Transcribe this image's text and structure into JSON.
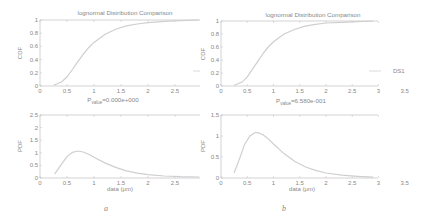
{
  "panels": [
    {
      "id": "a",
      "caption": "a",
      "cdf_title": "lognormal Distribution Comparison",
      "pdf_title_prefix": "P",
      "pdf_title_sub": "value",
      "pdf_title_suffix": "=0.000e+000",
      "cdf_ylabel": "CDF",
      "pdf_ylabel": "PDF",
      "xlabel": "data (μm)"
    },
    {
      "id": "b",
      "caption": "b",
      "cdf_title": "lognormal Distribution Comparison",
      "pdf_title_prefix": "P",
      "pdf_title_sub": "value",
      "pdf_title_suffix": "=6.580e-001",
      "cdf_ylabel": "CDF",
      "pdf_ylabel": "PDF",
      "xlabel": "data (μm)",
      "legend": "DS1"
    }
  ],
  "chart_data": [
    {
      "type": "line",
      "panel": "a-top",
      "title": "lognormal Distribution Comparison",
      "xlabel": "",
      "ylabel": "CDF",
      "xlim": [
        0,
        2.95
      ],
      "ylim": [
        0,
        1
      ],
      "xticks": [
        "0",
        "0.5",
        "1",
        "1.5",
        "2",
        "2.5"
      ],
      "yticks": [
        "0",
        "0.2",
        "0.4",
        "0.6",
        "0.8",
        "1"
      ],
      "series": [
        {
          "name": "lognormal CDF",
          "x": [
            0.25,
            0.4,
            0.5,
            0.6,
            0.7,
            0.8,
            0.9,
            1.0,
            1.2,
            1.4,
            1.6,
            1.8,
            2.0,
            2.3,
            2.6,
            2.95
          ],
          "y": [
            0.01,
            0.06,
            0.14,
            0.25,
            0.37,
            0.48,
            0.58,
            0.66,
            0.78,
            0.86,
            0.91,
            0.94,
            0.96,
            0.98,
            0.99,
            1.0
          ]
        }
      ],
      "grid": false
    },
    {
      "type": "line",
      "panel": "a-bottom",
      "title": "P_value=0.000e+000",
      "xlabel": "data (μm)",
      "ylabel": "PDF",
      "xlim": [
        0,
        2.95
      ],
      "ylim": [
        0,
        2.5
      ],
      "xticks": [
        "0",
        "0.5",
        "1",
        "1.5",
        "2",
        "2.5"
      ],
      "yticks": [
        "0",
        "0.5",
        "1",
        "1.5",
        "2",
        "2.5"
      ],
      "series": [
        {
          "name": "lognormal PDF",
          "x": [
            0.27,
            0.4,
            0.5,
            0.6,
            0.7,
            0.8,
            0.9,
            1.0,
            1.2,
            1.4,
            1.6,
            1.8,
            2.0,
            2.3,
            2.6,
            2.95
          ],
          "y": [
            0.15,
            0.55,
            0.85,
            1.02,
            1.07,
            1.03,
            0.94,
            0.82,
            0.6,
            0.42,
            0.28,
            0.19,
            0.13,
            0.08,
            0.05,
            0.04
          ]
        }
      ],
      "grid": false
    },
    {
      "type": "line",
      "panel": "b-top",
      "title": "lognormal Distribution Comparison",
      "xlabel": "",
      "ylabel": "CDF",
      "xlim": [
        0,
        3
      ],
      "ylim": [
        0,
        1
      ],
      "xticks": [
        "0",
        "0.5",
        "1",
        "1.5",
        "2",
        "2.5",
        "3",
        "3.5"
      ],
      "yticks": [
        "0",
        "0.2",
        "0.4",
        "0.6",
        "0.8",
        "1"
      ],
      "legend": [
        "DS1"
      ],
      "legend_position": "lower right outside",
      "series": [
        {
          "name": "DS1",
          "x": [
            0.25,
            0.4,
            0.5,
            0.6,
            0.7,
            0.8,
            0.9,
            1.0,
            1.2,
            1.4,
            1.6,
            1.8,
            2.0,
            2.3,
            2.6,
            2.9
          ],
          "y": [
            0.01,
            0.06,
            0.14,
            0.26,
            0.38,
            0.5,
            0.6,
            0.68,
            0.8,
            0.87,
            0.92,
            0.95,
            0.97,
            0.98,
            0.99,
            1.0
          ]
        }
      ],
      "grid": false
    },
    {
      "type": "line",
      "panel": "b-bottom",
      "title": "P_value=6.580e-001",
      "xlabel": "data (μm)",
      "ylabel": "PDF",
      "xlim": [
        0,
        3
      ],
      "ylim": [
        0,
        1.5
      ],
      "xticks": [
        "0",
        "0.5",
        "1",
        "1.5",
        "2",
        "2.5",
        "3",
        "3.5"
      ],
      "yticks": [
        "0",
        "0.5",
        "1",
        "1.5"
      ],
      "series": [
        {
          "name": "DS1",
          "x": [
            0.25,
            0.35,
            0.45,
            0.55,
            0.65,
            0.7,
            0.8,
            0.9,
            1.0,
            1.2,
            1.4,
            1.6,
            1.8,
            2.0,
            2.3,
            2.6,
            2.9
          ],
          "y": [
            0.12,
            0.45,
            0.8,
            1.0,
            1.08,
            1.08,
            1.03,
            0.93,
            0.81,
            0.58,
            0.4,
            0.27,
            0.18,
            0.12,
            0.07,
            0.04,
            0.02
          ]
        }
      ],
      "grid": false
    }
  ]
}
